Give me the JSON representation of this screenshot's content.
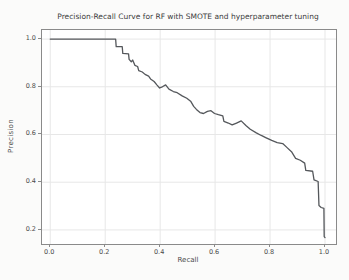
{
  "window": {
    "background": "#fbfbfa"
  },
  "chart_data": {
    "type": "line",
    "title": "Precision-Recall Curve for RF with SMOTE and hyperparameter tuning",
    "xlabel": "Recall",
    "ylabel": "Precision",
    "xlim": [
      -0.03,
      1.04
    ],
    "ylim": [
      0.141,
      1.038
    ],
    "x_ticks": [
      0.0,
      0.2,
      0.4,
      0.6,
      0.8,
      1.0
    ],
    "y_ticks": [
      0.2,
      0.4,
      0.6,
      0.8,
      1.0
    ],
    "grid": true,
    "legend": "none",
    "colors": {
      "line": "#54575b",
      "grid": "#e7e7e7",
      "spine": "#8a8a8a",
      "tick_label": "#4a4a4a",
      "title": "#3c3c3c"
    },
    "series": [
      {
        "name": "precision-recall-curve",
        "points": [
          [
            0.0,
            1.0
          ],
          [
            0.238,
            1.0
          ],
          [
            0.24,
            0.968
          ],
          [
            0.262,
            0.968
          ],
          [
            0.264,
            0.94
          ],
          [
            0.285,
            0.938
          ],
          [
            0.287,
            0.915
          ],
          [
            0.295,
            0.905
          ],
          [
            0.3,
            0.912
          ],
          [
            0.308,
            0.89
          ],
          [
            0.318,
            0.885
          ],
          [
            0.322,
            0.868
          ],
          [
            0.335,
            0.862
          ],
          [
            0.345,
            0.852
          ],
          [
            0.358,
            0.845
          ],
          [
            0.365,
            0.833
          ],
          [
            0.378,
            0.822
          ],
          [
            0.388,
            0.808
          ],
          [
            0.398,
            0.795
          ],
          [
            0.408,
            0.8
          ],
          [
            0.42,
            0.808
          ],
          [
            0.432,
            0.79
          ],
          [
            0.448,
            0.78
          ],
          [
            0.462,
            0.775
          ],
          [
            0.48,
            0.762
          ],
          [
            0.497,
            0.752
          ],
          [
            0.512,
            0.738
          ],
          [
            0.522,
            0.718
          ],
          [
            0.532,
            0.705
          ],
          [
            0.545,
            0.692
          ],
          [
            0.558,
            0.688
          ],
          [
            0.572,
            0.697
          ],
          [
            0.585,
            0.7
          ],
          [
            0.598,
            0.688
          ],
          [
            0.612,
            0.683
          ],
          [
            0.628,
            0.678
          ],
          [
            0.632,
            0.655
          ],
          [
            0.648,
            0.648
          ],
          [
            0.662,
            0.64
          ],
          [
            0.678,
            0.648
          ],
          [
            0.695,
            0.657
          ],
          [
            0.712,
            0.638
          ],
          [
            0.728,
            0.622
          ],
          [
            0.75,
            0.607
          ],
          [
            0.768,
            0.596
          ],
          [
            0.786,
            0.586
          ],
          [
            0.806,
            0.575
          ],
          [
            0.826,
            0.566
          ],
          [
            0.846,
            0.562
          ],
          [
            0.862,
            0.545
          ],
          [
            0.878,
            0.528
          ],
          [
            0.893,
            0.5
          ],
          [
            0.91,
            0.492
          ],
          [
            0.926,
            0.48
          ],
          [
            0.93,
            0.45
          ],
          [
            0.955,
            0.446
          ],
          [
            0.96,
            0.41
          ],
          [
            0.975,
            0.403
          ],
          [
            0.978,
            0.302
          ],
          [
            0.986,
            0.294
          ],
          [
            0.996,
            0.29
          ],
          [
            0.997,
            0.172
          ],
          [
            1.0,
            0.168
          ]
        ]
      }
    ]
  }
}
